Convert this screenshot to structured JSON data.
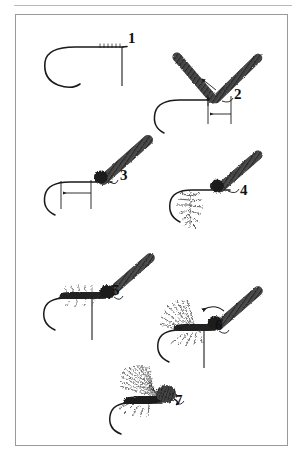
{
  "page": {
    "background_color": "#ffffff",
    "frame_color": "#9a9a9a",
    "ink_color": "#1a1a1a"
  },
  "diagram": {
    "total_steps": 7,
    "steps": [
      {
        "number": "1",
        "label_x": 128,
        "label_y": 38,
        "caption": "Bare hook in vise with thread base wrapped behind the eye and tying thread hanging down",
        "elements": [
          "hook",
          "thread-wraps",
          "hanging-thread"
        ]
      },
      {
        "number": "2",
        "label_x": 234,
        "label_y": 94,
        "caption": "Two quill wing slips tied in forming a V, with measuring reference lines and arrow",
        "elements": [
          "hook",
          "wing-quill-left",
          "wing-quill-right",
          "measure-lines",
          "measure-arrow"
        ]
      },
      {
        "number": "3",
        "label_x": 120,
        "label_y": 175,
        "caption": "Wing quills gathered into a single upright post with thread wraps at the base",
        "elements": [
          "hook",
          "wing-post",
          "thread-ball",
          "measure-lines",
          "measure-arrow"
        ]
      },
      {
        "number": "4",
        "label_x": 240,
        "label_y": 190,
        "caption": "Hackle feather tied in at the rear of the shank by its stem",
        "elements": [
          "hook",
          "wing-post",
          "thread-ball",
          "tied-in-hackle"
        ]
      },
      {
        "number": "5",
        "label_x": 112,
        "label_y": 290,
        "caption": "Dubbed body spun onto the thread and wrapped forward along the shank",
        "elements": [
          "hook",
          "wing-post",
          "thread-ball",
          "dubbed-body",
          "hanging-thread"
        ]
      },
      {
        "number": "6",
        "label_x": 215,
        "label_y": 325,
        "caption": "Hackle palmered forward through the body, arrow shows winding direction",
        "elements": [
          "hook",
          "wing-post",
          "thread-ball",
          "dubbed-body",
          "wound-hackle",
          "direction-arrow",
          "hanging-thread"
        ]
      },
      {
        "number": "7",
        "label_x": 175,
        "label_y": 400,
        "caption": "Finished fly with wing swept back over the body and a whip-finished head",
        "elements": [
          "hook",
          "swept-wing",
          "dubbed-body",
          "hackle-fibers",
          "head"
        ]
      }
    ],
    "annotations": {
      "measure_arrow_label": "wing length measurement",
      "direction_arrow_label": "hackle winding direction"
    }
  }
}
